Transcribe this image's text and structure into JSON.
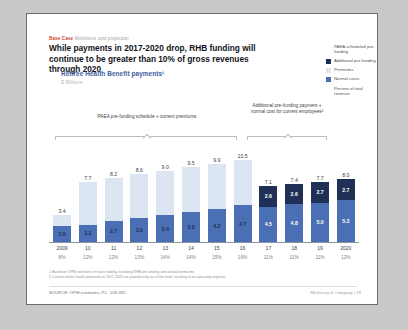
{
  "slide": {
    "kicker_bold": "Base Case",
    "kicker_rest": "Workforce cost projection",
    "headline": "While payments in 2017-2020 drop, RHB funding will continue to be greater than 10% of gross revenues through 2020",
    "subtitle": "Retiree Health Benefit payments¹",
    "units": "$ Billions",
    "footnote_1": "1 Based on OPM estimates of future liability, including RHB pre-funding and annual premiums",
    "footnote_2": "2 Current retiree health premiums in 2017-2020 are paid directly out of the fund, resulting in no operating expense",
    "source": "SOURCE: OPM estimates; P.L. 109-435",
    "footer": "McKinsey & Company   |   19"
  },
  "legend": {
    "items": [
      {
        "label": "PAEA scheduled pre-funding",
        "color": "#e8edf6",
        "swatch": false
      },
      {
        "label": "Additional pre-funding",
        "color": "#1f2f55",
        "swatch": true
      },
      {
        "label": "Premiums",
        "color": "#dce5f2",
        "swatch": true
      },
      {
        "label": "Normal costs",
        "color": "#4a6fb5",
        "swatch": true
      },
      {
        "label": "Percent of total revenue",
        "color": "#4a4f57",
        "swatch": false
      }
    ]
  },
  "brackets": {
    "left": "PAEA pre-funding schedule + current premiums",
    "right": "Additional pre-funding payment + normal cost for current employees²"
  },
  "chart_data": {
    "type": "bar",
    "title": "Retiree Health Benefit payments¹",
    "ylabel": "$ Billions",
    "xlabel": "",
    "grid": false,
    "legend_position": "right",
    "categories": [
      "2009",
      "10",
      "11",
      "12",
      "13",
      "14",
      "15",
      "16",
      "17",
      "18",
      "19",
      "2020"
    ],
    "totals": [
      3.4,
      7.7,
      8.2,
      8.6,
      9.0,
      9.5,
      9.9,
      10.5,
      7.1,
      7.4,
      7.7,
      8.0
    ],
    "percent_of_total_revenue": [
      "8%",
      "12%",
      "12%",
      "13%",
      "14%",
      "14%",
      "15%",
      "16%",
      "11%",
      "11%",
      "11%",
      "12%"
    ],
    "series": [
      {
        "name": "Normal costs",
        "color": "#4a6fb5",
        "values": [
          2.0,
          2.2,
          2.7,
          3.0,
          3.4,
          3.8,
          4.2,
          4.7,
          4.5,
          4.8,
          5.0,
          5.3
        ]
      },
      {
        "name": "Premiums",
        "color": "#dce5f2",
        "values": [
          1.4,
          5.5,
          5.5,
          5.6,
          5.6,
          5.7,
          5.7,
          5.8,
          null,
          null,
          null,
          null
        ]
      },
      {
        "name": "Additional pre-funding",
        "color": "#1f2f55",
        "values": [
          null,
          null,
          null,
          null,
          null,
          null,
          null,
          null,
          2.6,
          2.6,
          2.7,
          2.7
        ]
      },
      {
        "name": "PAEA scheduled pre-funding",
        "color": "#eef2f9",
        "values": [
          0.0,
          0.0,
          0.0,
          0.0,
          0.0,
          0.0,
          0.0,
          0.0,
          null,
          null,
          null,
          null
        ]
      }
    ]
  }
}
